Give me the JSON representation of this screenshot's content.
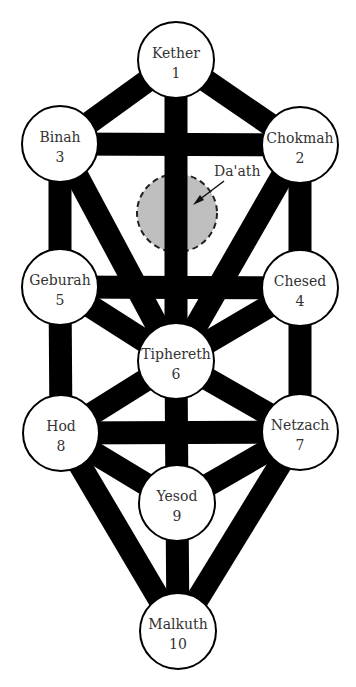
{
  "diagram": {
    "nodes": [
      {
        "id": "kether",
        "name": "Kether",
        "number": "1",
        "x": 176,
        "y": 60
      },
      {
        "id": "chokmah",
        "name": "Chokmah",
        "number": "2",
        "x": 300,
        "y": 145
      },
      {
        "id": "binah",
        "name": "Binah",
        "number": "3",
        "x": 60,
        "y": 144
      },
      {
        "id": "chesed",
        "name": "Chesed",
        "number": "4",
        "x": 300,
        "y": 288
      },
      {
        "id": "geburah",
        "name": "Geburah",
        "number": "5",
        "x": 60,
        "y": 287
      },
      {
        "id": "tiphereth",
        "name": "Tiphereth",
        "number": "6",
        "x": 176,
        "y": 361
      },
      {
        "id": "netzach",
        "name": "Netzach",
        "number": "7",
        "x": 300,
        "y": 432
      },
      {
        "id": "hod",
        "name": "Hod",
        "number": "8",
        "x": 61,
        "y": 433
      },
      {
        "id": "yesod",
        "name": "Yesod",
        "number": "9",
        "x": 177,
        "y": 503
      },
      {
        "id": "malkuth",
        "name": "Malkuth",
        "number": "10",
        "x": 178,
        "y": 631
      }
    ],
    "hidden_node": {
      "name": "Da'ath",
      "x": 177,
      "y": 213,
      "rx": 40,
      "ry": 39,
      "fill": "#bfbfbf",
      "style": "dashed"
    },
    "paths": [
      [
        "kether",
        "chokmah"
      ],
      [
        "kether",
        "binah"
      ],
      [
        "kether",
        "tiphereth"
      ],
      [
        "binah",
        "chokmah"
      ],
      [
        "binah",
        "geburah"
      ],
      [
        "binah",
        "tiphereth"
      ],
      [
        "chokmah",
        "chesed"
      ],
      [
        "chokmah",
        "tiphereth"
      ],
      [
        "geburah",
        "chesed"
      ],
      [
        "geburah",
        "tiphereth"
      ],
      [
        "chesed",
        "tiphereth"
      ],
      [
        "geburah",
        "hod"
      ],
      [
        "chesed",
        "netzach"
      ],
      [
        "tiphereth",
        "hod"
      ],
      [
        "tiphereth",
        "netzach"
      ],
      [
        "tiphereth",
        "yesod"
      ],
      [
        "hod",
        "netzach"
      ],
      [
        "hod",
        "yesod"
      ],
      [
        "netzach",
        "yesod"
      ],
      [
        "hod",
        "malkuth"
      ],
      [
        "netzach",
        "malkuth"
      ],
      [
        "yesod",
        "malkuth"
      ]
    ],
    "colors": {
      "path": "#000000",
      "node_fill": "#ffffff",
      "node_stroke": "#000000",
      "daath_fill": "#bfbfbf"
    }
  }
}
